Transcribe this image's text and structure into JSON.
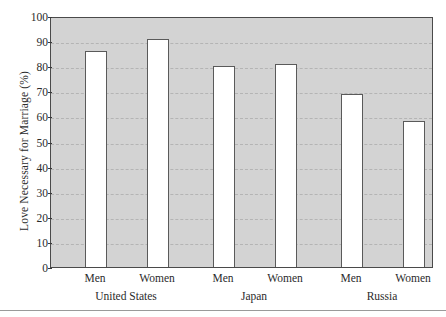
{
  "chart_data": {
    "type": "bar",
    "title": "",
    "subtitle": "",
    "xlabel": "",
    "ylabel": "Love Necessary for Marriage (%)",
    "ylim": [
      0,
      100
    ],
    "ytick_step": 10,
    "yticks": [
      0,
      10,
      20,
      30,
      40,
      50,
      60,
      70,
      80,
      90,
      100
    ],
    "grid": true,
    "grid_style": "dashed-horizontal",
    "legend": "none",
    "categories": [
      "Men",
      "Women",
      "Men",
      "Women",
      "Men",
      "Women"
    ],
    "groups": [
      "United States",
      "Japan",
      "Russia"
    ],
    "values": [
      86,
      91,
      80,
      81,
      69,
      58
    ],
    "bars": [
      {
        "group": "United States",
        "category": "Men",
        "value": 86
      },
      {
        "group": "United States",
        "category": "Women",
        "value": 91
      },
      {
        "group": "Japan",
        "category": "Men",
        "value": 80
      },
      {
        "group": "Japan",
        "category": "Women",
        "value": 81
      },
      {
        "group": "Russia",
        "category": "Men",
        "value": 69
      },
      {
        "group": "Russia",
        "category": "Women",
        "value": 58
      }
    ],
    "colors": {
      "bar_fill": "#ffffff",
      "bar_stroke": "#5a5a5a",
      "plot_background": "#d3d3d3",
      "axis": "#4a4a4a",
      "gridline": "#b4b4b4",
      "text": "#2b2b2b"
    }
  },
  "axis": {
    "y_title": "Love Necessary for Marriage (%)",
    "tick_labels": [
      "100",
      "90",
      "80",
      "70",
      "60",
      "50",
      "40",
      "30",
      "20",
      "10",
      "0"
    ]
  },
  "x_axis": {
    "category_labels": [
      "Men",
      "Women",
      "Men",
      "Women",
      "Men",
      "Women"
    ],
    "group_labels": [
      "United States",
      "Japan",
      "Russia"
    ]
  }
}
